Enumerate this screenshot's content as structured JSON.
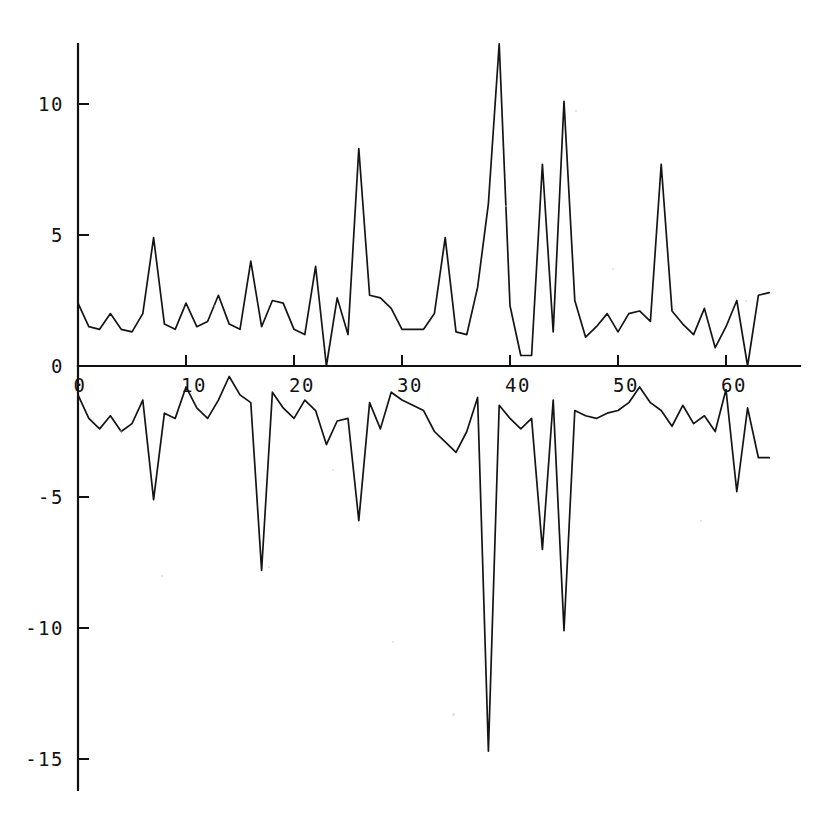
{
  "chart_data": {
    "type": "line",
    "title": "",
    "subtitle": "",
    "xlabel": "",
    "ylabel": "",
    "xlim": [
      0,
      64
    ],
    "ylim": [
      -15,
      12.5
    ],
    "grid": false,
    "legend": null,
    "legend_position": "none",
    "x_ticks": [
      0,
      10,
      20,
      30,
      40,
      50,
      60
    ],
    "x_tick_labels": [
      "0",
      "10",
      "20",
      "30",
      "40",
      "50",
      "60"
    ],
    "y_ticks": [
      10,
      5,
      0,
      -5,
      -10,
      -15
    ],
    "y_tick_labels": [
      "10",
      "5",
      "0",
      "-5",
      "-10",
      "-15"
    ],
    "x": [
      0,
      1,
      2,
      3,
      4,
      5,
      6,
      7,
      8,
      9,
      10,
      11,
      12,
      13,
      14,
      15,
      16,
      17,
      18,
      19,
      20,
      21,
      22,
      23,
      24,
      25,
      26,
      27,
      28,
      29,
      30,
      31,
      32,
      33,
      34,
      35,
      36,
      37,
      38,
      39,
      40,
      41,
      42,
      43,
      44,
      45,
      46,
      47,
      48,
      49,
      50,
      51,
      52,
      53,
      54,
      55,
      56,
      57,
      58,
      59,
      60,
      61,
      62,
      63,
      64
    ],
    "series": [
      {
        "name": "upper",
        "values": [
          2.4,
          1.5,
          1.4,
          2.0,
          1.4,
          1.3,
          2.0,
          4.9,
          1.6,
          1.4,
          2.4,
          1.5,
          1.7,
          2.7,
          1.6,
          1.4,
          4.0,
          1.5,
          2.5,
          2.4,
          1.4,
          1.2,
          3.8,
          0.0,
          2.6,
          1.2,
          8.3,
          2.7,
          2.6,
          2.2,
          1.4,
          1.4,
          1.4,
          2.0,
          4.9,
          1.3,
          1.2,
          3.0,
          6.2,
          12.3,
          2.3,
          0.4,
          0.4,
          7.7,
          1.3,
          10.1,
          2.5,
          1.1,
          1.5,
          2.0,
          1.3,
          2.0,
          2.1,
          1.7,
          7.7,
          2.1,
          1.6,
          1.2,
          2.2,
          0.7,
          1.5,
          2.5,
          0.0,
          2.7,
          2.8
        ]
      },
      {
        "name": "lower",
        "values": [
          -1.1,
          -2.0,
          -2.4,
          -1.9,
          -2.5,
          -2.2,
          -1.3,
          -5.1,
          -1.8,
          -2.0,
          -0.8,
          -1.6,
          -2.0,
          -1.3,
          -0.4,
          -1.1,
          -1.4,
          -7.8,
          -1.0,
          -1.6,
          -2.0,
          -1.3,
          -1.7,
          -3.0,
          -2.1,
          -2.0,
          -5.9,
          -1.4,
          -2.4,
          -1.0,
          -1.3,
          -1.5,
          -1.7,
          -2.5,
          -2.9,
          -3.3,
          -2.5,
          -1.2,
          -14.7,
          -1.5,
          -2.0,
          -2.4,
          -2.0,
          -7.0,
          -1.3,
          -10.1,
          -1.7,
          -1.9,
          -2.0,
          -1.8,
          -1.7,
          -1.4,
          -0.8,
          -1.4,
          -1.7,
          -2.3,
          -1.5,
          -2.2,
          -1.9,
          -2.5,
          -0.9,
          -4.8,
          -1.6,
          -3.5,
          -3.5
        ]
      }
    ],
    "colors": {
      "line": "#141414",
      "axis": "#111111",
      "background": "#ffffff"
    }
  }
}
